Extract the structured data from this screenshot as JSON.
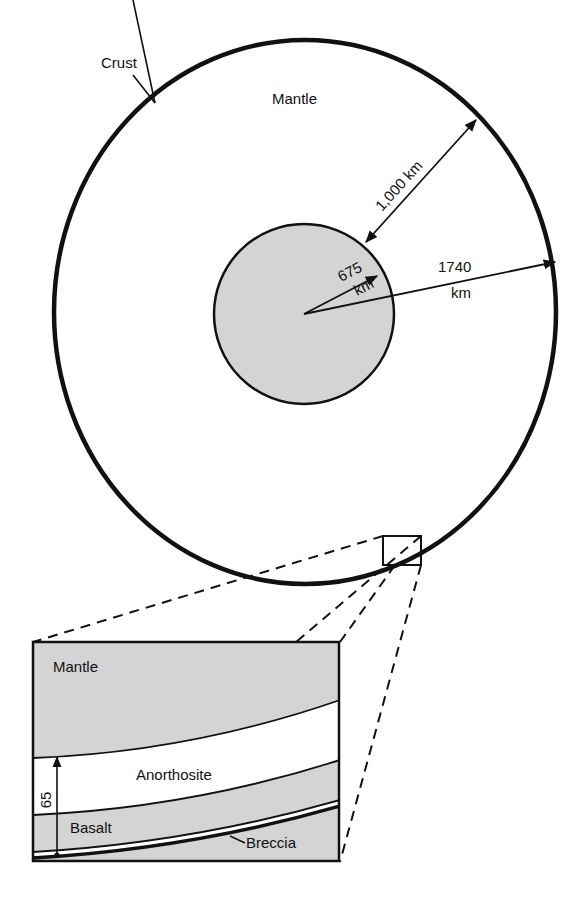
{
  "diagram": {
    "type": "cross-section",
    "colors": {
      "line": "#111111",
      "core_fill": "#d4d4d4",
      "mantle_fill": "#d4d4d4",
      "basalt_fill": "#d4d4d4",
      "anorthosite_fill": "#ffffff",
      "background": "#ffffff"
    },
    "globe": {
      "labels": {
        "crust": "Crust",
        "mantle": "Mantle"
      },
      "dimensions": {
        "mantle_thickness": "1,000 km",
        "core_radius_value": "675",
        "core_radius_unit": "km",
        "total_radius_value": "1740",
        "total_radius_unit": "km"
      }
    },
    "inset": {
      "labels": {
        "mantle": "Mantle",
        "anorthosite": "Anorthosite",
        "basalt": "Basalt",
        "breccia": "Breccia"
      },
      "dimension": {
        "thickness": "65"
      }
    }
  }
}
